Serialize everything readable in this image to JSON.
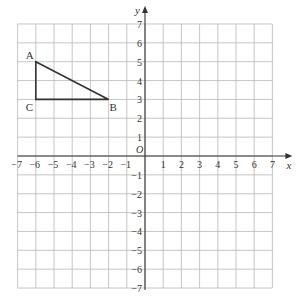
{
  "diagram": {
    "type": "coordinate-grid",
    "x_range": [
      -7,
      7
    ],
    "y_range": [
      -7,
      7
    ],
    "x_axis_label": "x",
    "y_axis_label": "y",
    "origin_label": "O",
    "x_ticks": [
      -7,
      -6,
      -5,
      -4,
      -3,
      -2,
      -1,
      1,
      2,
      3,
      4,
      5,
      6,
      7
    ],
    "y_ticks": [
      -7,
      -6,
      -5,
      -4,
      -3,
      -2,
      -1,
      1,
      2,
      3,
      4,
      5,
      6,
      7
    ],
    "shapes": [
      {
        "name": "triangle-ABC",
        "vertices": [
          {
            "label": "A",
            "x": -6,
            "y": 5
          },
          {
            "label": "B",
            "x": -2,
            "y": 3
          },
          {
            "label": "C",
            "x": -6,
            "y": 3
          }
        ]
      }
    ]
  },
  "colors": {
    "grid": "#b8b8b8",
    "axis": "#333333",
    "shape": "#333333",
    "text": "#333333"
  }
}
